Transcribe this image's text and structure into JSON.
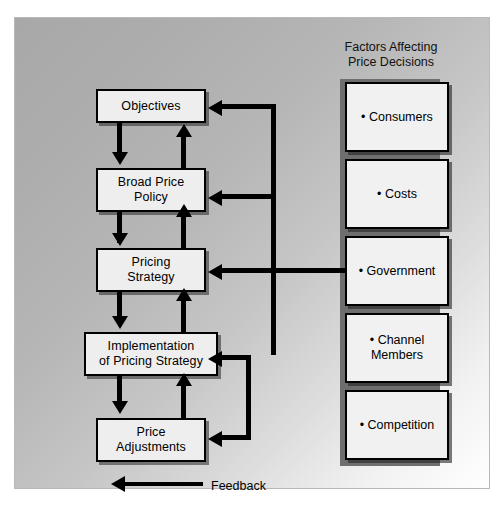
{
  "diagram": {
    "flow_steps": [
      {
        "label": "Objectives"
      },
      {
        "label": "Broad Price\nPolicy"
      },
      {
        "label": "Pricing\nStrategy"
      },
      {
        "label": "Implementation\nof Pricing Strategy"
      },
      {
        "label": "Price\nAdjustments"
      }
    ],
    "factors_title": "Factors Affecting\nPrice Decisions",
    "factors": [
      {
        "label": "• Consumers"
      },
      {
        "label": "• Costs"
      },
      {
        "label": "• Government"
      },
      {
        "label": "• Channel\nMembers"
      },
      {
        "label": "• Competition"
      }
    ],
    "legend": {
      "feedback_label": "Feedback",
      "arrow_icon": "left-arrow-icon"
    },
    "colors": {
      "box_fill": "#eeeeee",
      "box_border": "#000000",
      "column_strip": "#6e6e6e",
      "panel_border": "#b9b9b9",
      "arrow": "#000000"
    }
  }
}
